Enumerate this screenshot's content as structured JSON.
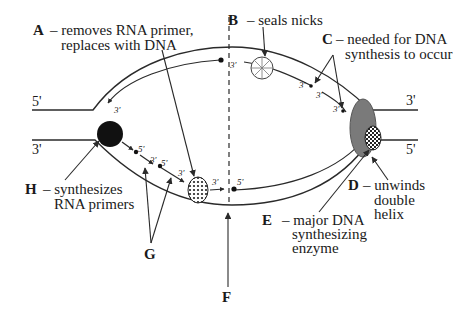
{
  "diagram": {
    "strand_ends": {
      "left_top": "5'",
      "left_bottom": "3'",
      "right_top": "3'",
      "right_bottom": "5'"
    },
    "small_ends": {
      "top_left_arrow": "3'",
      "top_near_dash": "3'",
      "c_frag1": "3'",
      "c_frag2_top": "3'",
      "c_frag2_bot": "3'",
      "g1": "5'",
      "g2a": "3'",
      "g2b": "5'",
      "g3": "3'",
      "after_a": "3'",
      "bottom_right": "5'"
    },
    "labels": {
      "A": {
        "letter": "A",
        "line1": "– removes RNA primer,",
        "line2": "replaces with DNA"
      },
      "B": {
        "letter": "B",
        "line1": "– seals nicks"
      },
      "C": {
        "letter": "C",
        "line1": "– needed for DNA",
        "line2": "synthesis to occur"
      },
      "D": {
        "letter": "D",
        "line1": "– unwinds",
        "line2": "double",
        "line3": "helix"
      },
      "E": {
        "letter": "E",
        "line1": "– major DNA",
        "line2": "synthesizing",
        "line3": "enzyme"
      },
      "F": {
        "letter": "F"
      },
      "G": {
        "letter": "G"
      },
      "H": {
        "letter": "H",
        "line1": "– synthesizes",
        "line2": "RNA primers"
      }
    },
    "colors": {
      "line": "#2a2a2a",
      "helicase": "#7a7a7a",
      "primase": "#111111"
    }
  }
}
